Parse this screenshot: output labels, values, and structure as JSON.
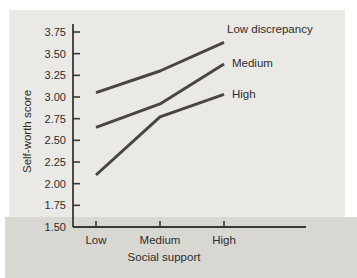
{
  "chart_data": {
    "type": "line",
    "xlabel": "Social support",
    "ylabel": "Self-worth score",
    "categories": [
      "Low",
      "Medium",
      "High"
    ],
    "series": [
      {
        "name": "Low discrepancy",
        "values": [
          3.05,
          3.3,
          3.63
        ],
        "color": "#4a4542"
      },
      {
        "name": "Medium",
        "values": [
          2.65,
          2.92,
          3.38
        ],
        "color": "#4a4542"
      },
      {
        "name": "High",
        "values": [
          2.1,
          2.77,
          3.03
        ],
        "color": "#4a4542"
      }
    ],
    "ylim": [
      1.5,
      3.75
    ],
    "yticks": [
      3.75,
      3.5,
      3.25,
      3.0,
      2.75,
      2.5,
      2.25,
      2.0,
      1.75,
      1.5
    ],
    "ytick_decimals": 2,
    "grid": false,
    "legend_position": "line-end-labels",
    "colors": {
      "axis": "#3a3835",
      "text": "#2e2c29",
      "panel": "#eae9e6",
      "band": "#d8d7d2",
      "page": "#ffffff"
    }
  }
}
